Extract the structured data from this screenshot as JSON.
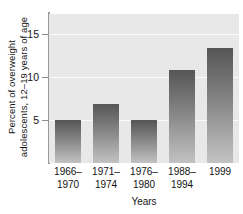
{
  "chart_data": {
    "type": "bar",
    "title": "",
    "categories": [
      "1966–\n1970",
      "1971–\n1974",
      "1976–\n1980",
      "1988–\n1994",
      "1999"
    ],
    "values": [
      5.0,
      6.9,
      5.0,
      10.8,
      13.4
    ],
    "xlabel": "Years",
    "ylabel": "Percent of overweight\nadolescents, 12–19 years of age",
    "ylim": [
      0,
      17.3
    ],
    "yticks": [
      5,
      10,
      15
    ],
    "ytick_labels": [
      "5",
      "10",
      "15"
    ],
    "grid": true,
    "legend": "none",
    "colors": {
      "plot_background": "#e8e8e8",
      "gridline": "#fbfbfb",
      "axis": "#9a9a9a",
      "bar_top": "#565656",
      "bar_bottom": "#c2c2c2",
      "text": "#141414",
      "page_background": "#ffffff"
    }
  }
}
